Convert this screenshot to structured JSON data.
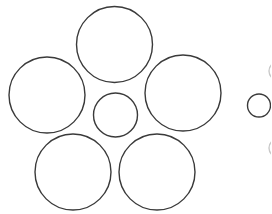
{
  "figure": {
    "title": "",
    "stroke_color": "#3a3a3a",
    "background": "#ffffff",
    "left_group": {
      "center_circle": {
        "cx": 115,
        "cy": 115,
        "r": 22
      },
      "surrounding_circles": [
        {
          "cx": 114.5,
          "cy": 44.5,
          "r": 38
        },
        {
          "cx": 47,
          "cy": 95,
          "r": 38
        },
        {
          "cx": 183,
          "cy": 93,
          "r": 38
        },
        {
          "cx": 73,
          "cy": 172,
          "r": 38
        },
        {
          "cx": 157,
          "cy": 172,
          "r": 38
        }
      ]
    },
    "right_group": {
      "center_circle": {
        "cx": 259,
        "cy": 105.5,
        "r": 11.5
      },
      "partial_arcs": [
        {
          "cx": 277,
          "cy": 71,
          "r": 9
        },
        {
          "cx": 277,
          "cy": 148,
          "r": 9
        }
      ]
    }
  }
}
